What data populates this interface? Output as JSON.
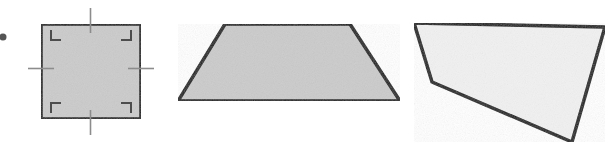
{
  "figure": {
    "width": 611,
    "height": 150,
    "background_color": "#ffffff",
    "outline_color": "#1a1a1a",
    "tick_color": "#8c8c8c",
    "angle_mark_color": "#4d4d4d"
  },
  "bullet": {
    "name": "list-bullet",
    "cx": 3,
    "cy": 37,
    "r": 3.5,
    "color": "#555555"
  },
  "shapes": [
    {
      "id": "square",
      "label": "Square",
      "fill": "#cbcbcb",
      "stroke_width": 3.5,
      "points": "41,24 141,24 141,119 41,119",
      "has_right_angle_marks": true,
      "has_side_ticks": true,
      "right_angle_marks": [
        {
          "name": "right-angle-mark-top-left",
          "d": "M 51,30 L 51,40 L 61,40"
        },
        {
          "name": "right-angle-mark-top-right",
          "d": "M 131,30 L 131,40 L 121,40"
        },
        {
          "name": "right-angle-mark-bottom-left",
          "d": "M 51,113 L 51,103 L 61,103"
        },
        {
          "name": "right-angle-mark-bottom-right",
          "d": "M 131,113 L 131,103 L 121,103"
        }
      ],
      "side_ticks": [
        {
          "name": "side-tick-top",
          "x1": 90.5,
          "y1": 8,
          "x2": 90.5,
          "y2": 33
        },
        {
          "name": "side-tick-bottom",
          "x1": 90.5,
          "y1": 110,
          "x2": 90.5,
          "y2": 135
        },
        {
          "name": "side-tick-left",
          "x1": 28,
          "y1": 68.5,
          "x2": 54,
          "y2": 68.5
        },
        {
          "name": "side-tick-right",
          "x1": 128,
          "y1": 68.5,
          "x2": 154,
          "y2": 68.5
        }
      ]
    },
    {
      "id": "trapezoid",
      "label": "Trapezoid",
      "fill": "#cbcbcb",
      "stroke_width": 3.5,
      "points": "225,24 350,24 400,101 178,101",
      "has_right_angle_marks": false,
      "has_side_ticks": false,
      "right_angle_marks": [],
      "side_ticks": []
    },
    {
      "id": "irregular-quadrilateral",
      "label": "Irregular quadrilateral",
      "fill": "#f1f1f1",
      "stroke_width": 3.5,
      "points": "414,23 605,27 572,142 432,82",
      "has_right_angle_marks": false,
      "has_side_ticks": false,
      "right_angle_marks": [],
      "side_ticks": []
    }
  ]
}
